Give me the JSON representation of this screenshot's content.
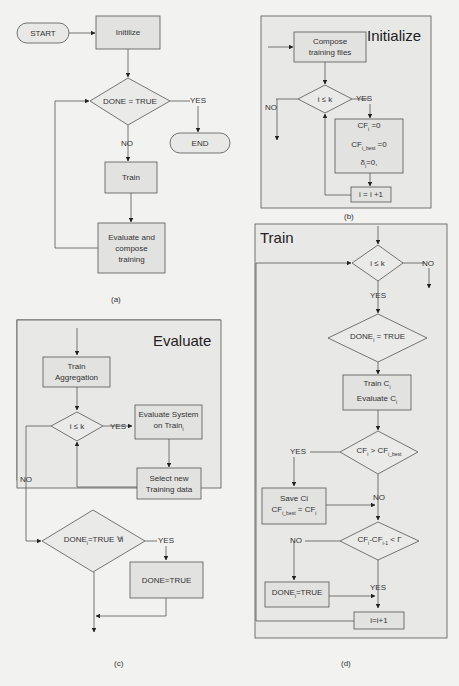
{
  "panel_a": {
    "caption": "(a)",
    "start": "START",
    "init": "Initilize",
    "decision": "DONE = TRUE",
    "yes": "YES",
    "no": "NO",
    "end": "END",
    "train": "Train",
    "evaluate_l1": "Evaluate and",
    "evaluate_l2": "compose",
    "evaluate_l3": "training"
  },
  "panel_b": {
    "caption": "(b)",
    "title": "Initialize",
    "compose_l1": "Compose",
    "compose_l2": "training files",
    "decision": "i ≤ k",
    "yes": "YES",
    "no": "NO",
    "assign1": "CF",
    "assign1_sub": "i",
    "assign1_rest": " =0",
    "assign2": "CF",
    "assign2_sub": "i_best",
    "assign2_rest": " =0",
    "assign3": "δ",
    "assign3_sub": "i",
    "assign3_rest": "=0,",
    "increment": "i = i +1"
  },
  "panel_c": {
    "caption": "(c)",
    "title": "Evaluate",
    "aggregation_l1": "Train",
    "aggregation_l2": "Aggregation",
    "decision": "i ≤ k",
    "yes": "YES",
    "no": "NO",
    "eval_l1": "Evaluate System",
    "eval_l2": "on Train",
    "eval_sub": "i",
    "select_l1": "Select new",
    "select_l2": "Training data",
    "decision2": "DONE",
    "decision2_sub": "i",
    "decision2_rest": "=TRUE ∀i",
    "yes2": "YES",
    "done": "DONE=TRUE"
  },
  "panel_d": {
    "caption": "(d)",
    "title": "Train",
    "decision1": "i ≤ k",
    "no1": "NO",
    "yes1": "YES",
    "decision2": "DONE",
    "decision2_sub": "i",
    "decision2_rest": " = TRUE",
    "train_l1": "Train C",
    "train_l2": "Evaluate C",
    "sub_i": "i",
    "decision3": "CF",
    "decision3_mid": " > CF",
    "decision3_sub2": "i_best",
    "yes3": "YES",
    "no3": "NO",
    "save_l1": "Save Ci",
    "save_l2": "CF",
    "save_sub": "i_best",
    "save_rest": " = CF",
    "decision4": "CF",
    "decision4_mid": "-CF",
    "decision4_sub2": "i-1",
    "decision4_rest": " < Γ",
    "no4": "NO",
    "yes4": "YES",
    "done_i": "DONE",
    "done_rest": "=TRUE",
    "increment": "i=i+1"
  }
}
